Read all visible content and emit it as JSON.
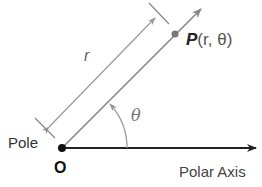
{
  "diagram": {
    "labels": {
      "pole": "Pole",
      "origin": "O",
      "polar_axis": "Polar Axis",
      "radius": "r",
      "angle": "θ",
      "point_name": "P",
      "point_args": "(r, θ)"
    },
    "colors": {
      "axis": "#222222",
      "ray": "#888888",
      "dimension": "#999999",
      "point": "#777777",
      "origin_dot": "#111111"
    }
  }
}
